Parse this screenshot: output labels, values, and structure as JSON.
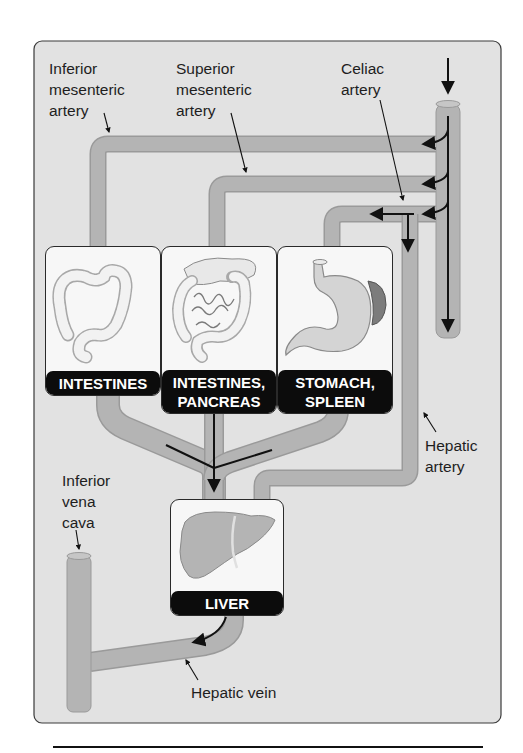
{
  "diagram": {
    "colors": {
      "panel_bg": "#e2e2e2",
      "vessel_fill": "#b4b4b4",
      "vessel_edge": "#9a9a9a",
      "caption_bg": "#0c0c0c",
      "caption_text": "#ffffff",
      "arrow": "#111111"
    },
    "labels": {
      "inferior_mesenteric": "Inferior\nmesenteric\nartery",
      "superior_mesenteric": "Superior\nmesenteric\nartery",
      "celiac": "Celiac\nartery",
      "hepatic_artery": "Hepatic\nartery",
      "inferior_vena_cava": "Inferior\nvena\ncava",
      "hepatic_vein": "Hepatic vein"
    },
    "organs": [
      {
        "id": "intestines",
        "caption": "INTESTINES",
        "icon": "large-intestine-icon"
      },
      {
        "id": "intestines-pancreas",
        "caption": "INTESTINES,\nPANCREAS",
        "icon": "intestines-pancreas-icon"
      },
      {
        "id": "stomach-spleen",
        "caption": "STOMACH,\nSPLEEN",
        "icon": "stomach-spleen-icon"
      },
      {
        "id": "liver",
        "caption": "LIVER",
        "icon": "liver-icon"
      }
    ]
  }
}
